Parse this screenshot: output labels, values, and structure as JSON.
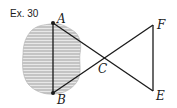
{
  "exercise_label": "Ex. 30",
  "points": {
    "A": {
      "label": "A",
      "x": 53,
      "y": 23
    },
    "B": {
      "label": "B",
      "x": 53,
      "y": 93
    },
    "C": {
      "label": "C",
      "x": 103,
      "y": 58
    },
    "E": {
      "label": "E",
      "x": 153,
      "y": 91
    },
    "F": {
      "label": "F",
      "x": 153,
      "y": 25
    }
  },
  "colors": {
    "line": "#1a1a1a",
    "blob_fill": "#c8c8c8",
    "blob_hatch": "#e6e6e6"
  }
}
